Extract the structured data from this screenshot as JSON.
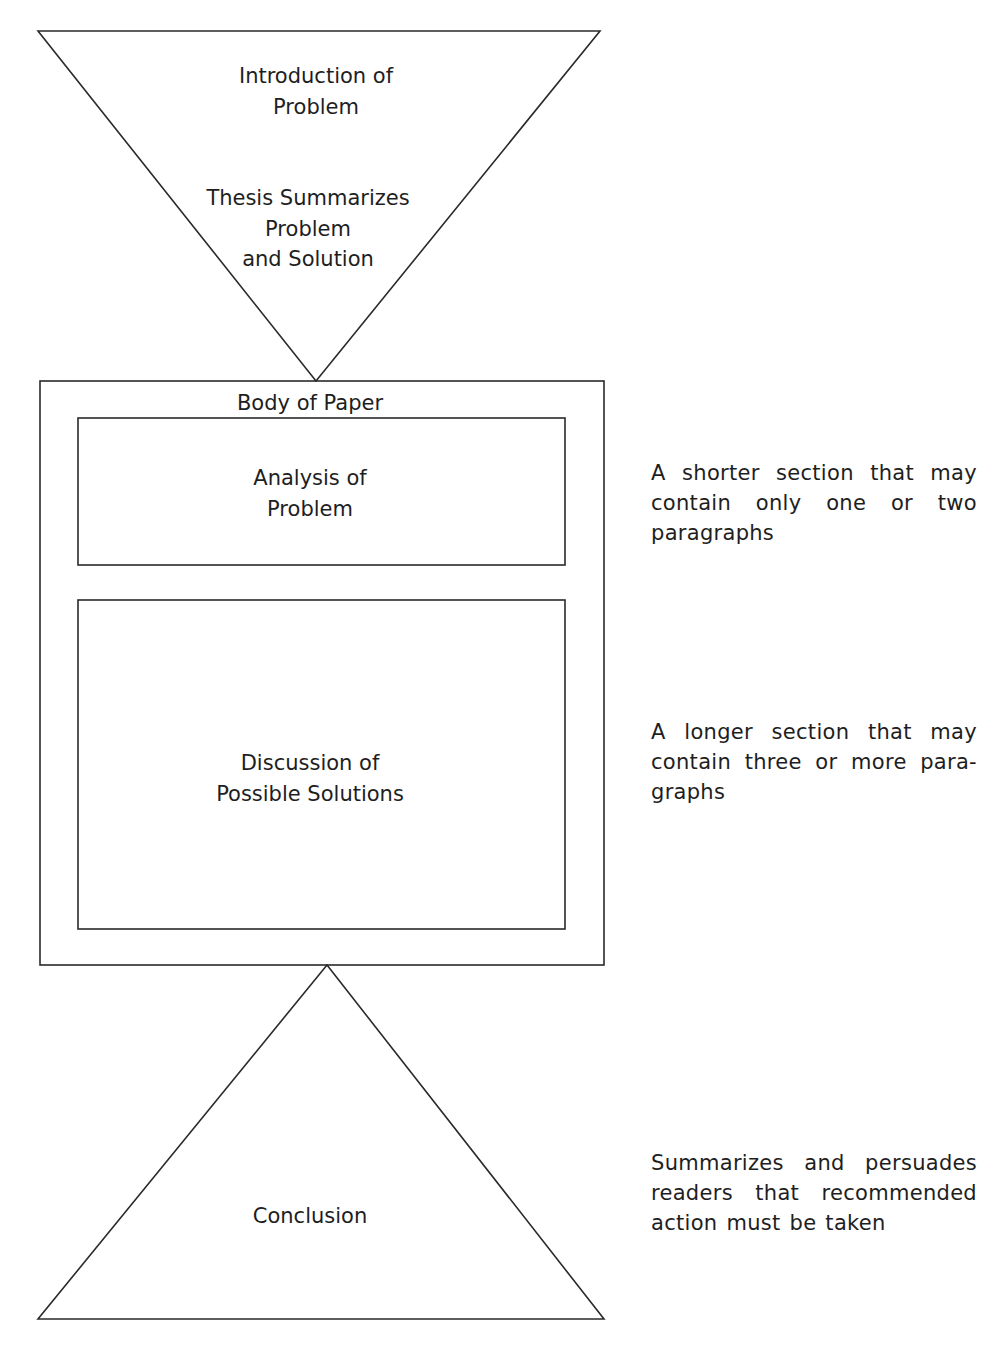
{
  "diagram": {
    "colors": {
      "stroke": "#2a2a2a",
      "text": "#1e1e1e",
      "background": "#ffffff"
    },
    "introduction": {
      "shape": "inverted-triangle",
      "line1": "Introduction of",
      "line2": "Problem",
      "thesis_line1": "Thesis Summarizes",
      "thesis_line2": "Problem",
      "thesis_line3": "and Solution"
    },
    "body": {
      "shape": "rectangle",
      "label": "Body of Paper",
      "analysis": {
        "line1": "Analysis of",
        "line2": "Problem",
        "note_line1": "A shorter section that may",
        "note_line2": "contain only one or two",
        "note_line3": "paragraphs"
      },
      "discussion": {
        "line1": "Discussion of",
        "line2": "Possible Solutions",
        "note_line1": "A longer section that may",
        "note_line2": "contain three or more para-",
        "note_line3": "graphs"
      }
    },
    "conclusion": {
      "shape": "triangle",
      "label": "Conclusion",
      "note_line1": "Summarizes and persuades",
      "note_line2": "readers that recommended",
      "note_line3": "action must be taken"
    }
  }
}
